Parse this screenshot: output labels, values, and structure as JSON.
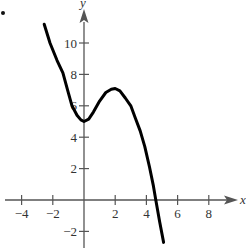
{
  "chart_data": {
    "type": "line",
    "title": "",
    "xlabel": "x",
    "ylabel": "y",
    "xlim": [
      -4.5,
      10
    ],
    "ylim": [
      -2.9,
      12
    ],
    "grid": false,
    "legend": null,
    "x_ticks": [
      -4,
      -2,
      2,
      4,
      6,
      8
    ],
    "x_tick_labels": [
      "−4",
      "−2",
      "2",
      "4",
      "6",
      "8"
    ],
    "y_ticks": [
      -2,
      2,
      4,
      6,
      8,
      10
    ],
    "y_tick_labels": [
      "−2",
      "2",
      "4",
      "6",
      "8",
      "10"
    ],
    "annotations": [
      "local minimum near (0, 5)",
      "local maximum near (2, 7)",
      "x-intercept near 4.6"
    ],
    "series": [
      {
        "name": "f(x)",
        "color": "#000000",
        "x": [
          -2.55,
          -2.18,
          -1.73,
          -1.35,
          -1.05,
          -0.77,
          -0.45,
          -0.2,
          0.0,
          0.3,
          0.6,
          1.0,
          1.4,
          1.75,
          2.0,
          2.3,
          2.65,
          3.0,
          3.3,
          3.6,
          3.9,
          4.2,
          4.45,
          4.6,
          4.85,
          5.1
        ],
        "y": [
          11.2,
          10.0,
          8.9,
          8.1,
          7.0,
          6.0,
          5.4,
          5.1,
          5.0,
          5.15,
          5.6,
          6.3,
          6.85,
          7.05,
          7.1,
          6.95,
          6.5,
          6.0,
          5.2,
          4.4,
          3.4,
          2.1,
          0.9,
          0.0,
          -1.4,
          -2.7
        ]
      }
    ]
  },
  "figure": {
    "bullet": "•"
  }
}
